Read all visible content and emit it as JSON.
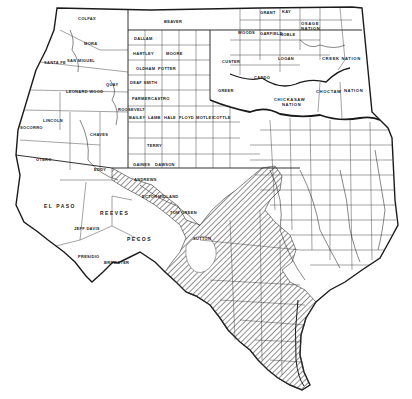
{
  "map": {
    "title": "",
    "background": "#ffffff",
    "ink_color": "#1a1a1a",
    "hatch_color": "#333333",
    "regions": {
      "territory_labels": [
        {
          "text": "CREEK NATION",
          "x": 335,
          "y": 59
        },
        {
          "text": "CHOCTAW",
          "x": 318,
          "y": 92
        },
        {
          "text": "NATION",
          "x": 348,
          "y": 90
        },
        {
          "text": "CHICKASAW",
          "x": 283,
          "y": 98
        },
        {
          "text": "NATION",
          "x": 288,
          "y": 103
        },
        {
          "text": "OSAGE",
          "x": 300,
          "y": 24
        },
        {
          "text": "NATION",
          "x": 302,
          "y": 28
        },
        {
          "text": "CHEROKEE",
          "x": 274,
          "y": 58
        }
      ],
      "county_labels": [
        {
          "text": "COLFAX",
          "x": 78,
          "y": 20
        },
        {
          "text": "MORA",
          "x": 83,
          "y": 44
        },
        {
          "text": "SAN MIGUEL",
          "x": 74,
          "y": 60
        },
        {
          "text": "SANTA FE",
          "x": 44,
          "y": 61
        },
        {
          "text": "BERNALILLO",
          "x": 34,
          "y": 84
        },
        {
          "text": "VALENCIA",
          "x": 48,
          "y": 94
        },
        {
          "text": "LEONARD WOOD",
          "x": 68,
          "y": 90
        },
        {
          "text": "GUADALUPE",
          "x": 70,
          "y": 91
        },
        {
          "text": "QUAY",
          "x": 106,
          "y": 84
        },
        {
          "text": "SOCORRO",
          "x": 20,
          "y": 128
        },
        {
          "text": "LINCOLN",
          "x": 44,
          "y": 120
        },
        {
          "text": "ROOSEVELT",
          "x": 120,
          "y": 109
        },
        {
          "text": "CHAVES",
          "x": 90,
          "y": 133
        },
        {
          "text": "OTERO",
          "x": 38,
          "y": 159
        },
        {
          "text": "DONA ANA",
          "x": 23,
          "y": 158
        },
        {
          "text": "EDDY",
          "x": 90,
          "y": 169
        },
        {
          "text": "EL PASO",
          "x": 48,
          "y": 206
        },
        {
          "text": "REEVES",
          "x": 100,
          "y": 212
        },
        {
          "text": "JEFF DAVIS",
          "x": 75,
          "y": 228
        },
        {
          "text": "PECOS",
          "x": 127,
          "y": 238
        },
        {
          "text": "PRESIDIO",
          "x": 78,
          "y": 255
        },
        {
          "text": "BREWSTER",
          "x": 105,
          "y": 262
        },
        {
          "text": "BEAVER",
          "x": 166,
          "y": 22
        },
        {
          "text": "DALLAM",
          "x": 138,
          "y": 37
        },
        {
          "text": "HARTLEY",
          "x": 136,
          "y": 52
        },
        {
          "text": "MOORE",
          "x": 168,
          "y": 53
        },
        {
          "text": "OLDHAM",
          "x": 138,
          "y": 68
        },
        {
          "text": "POTTER",
          "x": 160,
          "y": 67
        },
        {
          "text": "RANDALL",
          "x": 174,
          "y": 80
        },
        {
          "text": "DEAF SMITH",
          "x": 133,
          "y": 82
        },
        {
          "text": "GREER",
          "x": 222,
          "y": 90
        },
        {
          "text": "PARMER",
          "x": 136,
          "y": 98
        },
        {
          "text": "CASTRO",
          "x": 155,
          "y": 98
        },
        {
          "text": "BAILEY",
          "x": 130,
          "y": 116
        },
        {
          "text": "LAMB",
          "x": 150,
          "y": 116
        },
        {
          "text": "HALE",
          "x": 165,
          "y": 116
        },
        {
          "text": "FLOYD",
          "x": 180,
          "y": 116
        },
        {
          "text": "MOTLEY",
          "x": 198,
          "y": 116
        },
        {
          "text": "COTTLE",
          "x": 215,
          "y": 116
        },
        {
          "text": "COCHRAN",
          "x": 131,
          "y": 133
        },
        {
          "text": "HOCKLEY",
          "x": 148,
          "y": 133
        },
        {
          "text": "LUBBOCK",
          "x": 165,
          "y": 133
        },
        {
          "text": "YOAKUM",
          "x": 130,
          "y": 145
        },
        {
          "text": "TERRY",
          "x": 150,
          "y": 145
        },
        {
          "text": "LYNN",
          "x": 168,
          "y": 147
        },
        {
          "text": "GAINES",
          "x": 135,
          "y": 164
        },
        {
          "text": "DAWSON",
          "x": 158,
          "y": 164
        },
        {
          "text": "BORDEN",
          "x": 178,
          "y": 164
        },
        {
          "text": "ANDREWS",
          "x": 137,
          "y": 179
        },
        {
          "text": "ECTOR",
          "x": 145,
          "y": 196
        },
        {
          "text": "MIDLAND",
          "x": 163,
          "y": 196
        },
        {
          "text": "TOM GREEN",
          "x": 173,
          "y": 212
        },
        {
          "text": "SUTTON",
          "x": 195,
          "y": 237
        },
        {
          "text": "GRANT",
          "x": 262,
          "y": 12
        },
        {
          "text": "KAY",
          "x": 283,
          "y": 11
        },
        {
          "text": "WOODS",
          "x": 240,
          "y": 32
        },
        {
          "text": "GARFIELD",
          "x": 263,
          "y": 33
        },
        {
          "text": "NOBLE",
          "x": 282,
          "y": 34
        },
        {
          "text": "PAWNEE",
          "x": 292,
          "y": 45
        },
        {
          "text": "CUSTER",
          "x": 224,
          "y": 61
        },
        {
          "text": "BLAINE",
          "x": 226,
          "y": 55
        },
        {
          "text": "KIOWA",
          "x": 233,
          "y": 74
        },
        {
          "text": "CADDO",
          "x": 256,
          "y": 77
        },
        {
          "text": "LOGAN",
          "x": 280,
          "y": 58
        },
        {
          "text": "LINCOLN",
          "x": 293,
          "y": 59
        },
        {
          "text": "GRAYSON",
          "x": 306,
          "y": 133
        },
        {
          "text": "LAMAR",
          "x": 340,
          "y": 133
        },
        {
          "text": "BOWIE",
          "x": 372,
          "y": 132
        },
        {
          "text": "DALLAS",
          "x": 307,
          "y": 170
        },
        {
          "text": "MCLENNAN",
          "x": 310,
          "y": 187
        },
        {
          "text": "LEON",
          "x": 325,
          "y": 205
        },
        {
          "text": "HARRIS",
          "x": 345,
          "y": 250
        },
        {
          "text": "SABINE",
          "x": 397,
          "y": 215
        },
        {
          "text": "TRAVIS",
          "x": 280,
          "y": 234
        },
        {
          "text": "BEXAR",
          "x": 248,
          "y": 266
        }
      ]
    },
    "legend": {
      "hatched_area": "Shaded region (diagonal hatching) across central and south Texas"
    }
  }
}
